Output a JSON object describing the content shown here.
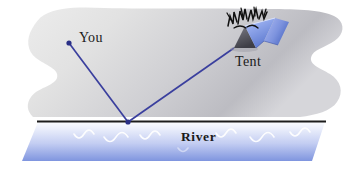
{
  "figure": {
    "labels": {
      "you": "You",
      "tent": "Tent",
      "river": "River"
    },
    "colors": {
      "land_light": "#e3e3e3",
      "land_dark": "#b9b9bd",
      "river_top": "#f2f4fc",
      "river_bottom": "#7d93de",
      "ray": "#3a3f9e",
      "bank_line": "#1c1c1c",
      "tent_blue": "#8fa6e8",
      "tent_blue_dark": "#5d79cf",
      "tent_face_gray": "#5a5a62",
      "fire_black": "#101010",
      "wave_white": "#ffffff",
      "text": "#1a1a1a"
    },
    "geometry": {
      "you_point": [
        69,
        43
      ],
      "reflection_point": [
        128,
        122
      ],
      "tent_point": [
        234,
        48
      ],
      "bank_line_y": 121
    },
    "elements": {
      "land": "land-mass",
      "river": "river-band",
      "bank": "river-bank-line",
      "ray_incoming": "ray-you-to-water",
      "ray_outgoing": "ray-water-to-tent",
      "tent": "tent-icon",
      "fire": "campfire-icon",
      "waves": "water-waves"
    }
  }
}
